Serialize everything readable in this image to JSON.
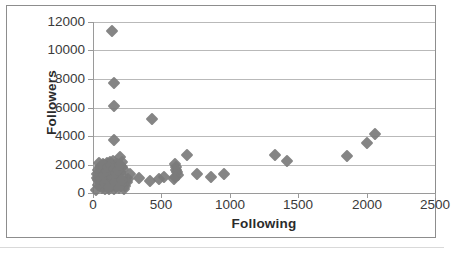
{
  "chart_data": {
    "type": "scatter",
    "title": "",
    "xlabel": "Following",
    "ylabel": "Followers",
    "xlim": [
      0,
      2500
    ],
    "ylim": [
      0,
      12000
    ],
    "xticks": [
      0,
      500,
      1000,
      1500,
      2000,
      2500
    ],
    "yticks": [
      0,
      2000,
      4000,
      6000,
      8000,
      10000,
      12000
    ],
    "xtick_labels": [
      "0",
      "500",
      "1000",
      "1500",
      "2000",
      "2500"
    ],
    "ytick_labels": [
      "0",
      "2000",
      "4000",
      "6000",
      "8000",
      "10000",
      "12000"
    ],
    "grid": "horizontal",
    "legend": "none",
    "marker": "diamond",
    "marker_color": "#7b7b7b",
    "series": [
      {
        "name": "accounts",
        "points": [
          [
            140,
            11350
          ],
          [
            150,
            7750
          ],
          [
            150,
            6100
          ],
          [
            430,
            5200
          ],
          [
            150,
            3700
          ],
          [
            2060,
            4150
          ],
          [
            2000,
            3500
          ],
          [
            1860,
            2600
          ],
          [
            690,
            2700
          ],
          [
            1330,
            2650
          ],
          [
            1420,
            2250
          ],
          [
            200,
            2500
          ],
          [
            215,
            2150
          ],
          [
            190,
            2000
          ],
          [
            600,
            2050
          ],
          [
            610,
            1800
          ],
          [
            605,
            1600
          ],
          [
            615,
            1450
          ],
          [
            620,
            1250
          ],
          [
            600,
            1100
          ],
          [
            595,
            950
          ],
          [
            760,
            1350
          ],
          [
            960,
            1300
          ],
          [
            860,
            1150
          ],
          [
            335,
            1050
          ],
          [
            420,
            850
          ],
          [
            480,
            1000
          ],
          [
            520,
            1150
          ],
          [
            270,
            1300
          ],
          [
            255,
            1000
          ],
          [
            245,
            750
          ],
          [
            235,
            500
          ],
          [
            225,
            300
          ],
          [
            30,
            1050
          ],
          [
            40,
            900
          ],
          [
            50,
            1400
          ],
          [
            55,
            700
          ],
          [
            60,
            1850
          ],
          [
            65,
            1500
          ],
          [
            70,
            500
          ],
          [
            75,
            1250
          ],
          [
            80,
            2000
          ],
          [
            85,
            300
          ],
          [
            90,
            1650
          ],
          [
            95,
            1150
          ],
          [
            100,
            800
          ],
          [
            105,
            2100
          ],
          [
            110,
            450
          ],
          [
            115,
            1550
          ],
          [
            120,
            1900
          ],
          [
            125,
            1000
          ],
          [
            130,
            1350
          ],
          [
            135,
            600
          ],
          [
            140,
            1750
          ],
          [
            145,
            2250
          ],
          [
            150,
            1450
          ],
          [
            155,
            250
          ],
          [
            160,
            1150
          ],
          [
            165,
            1900
          ],
          [
            170,
            800
          ],
          [
            175,
            1600
          ],
          [
            180,
            1300
          ],
          [
            185,
            950
          ],
          [
            190,
            1750
          ],
          [
            195,
            550
          ],
          [
            200,
            1450
          ],
          [
            25,
            200
          ],
          [
            35,
            1600
          ],
          [
            45,
            2100
          ],
          [
            55,
            1100
          ],
          [
            65,
            350
          ],
          [
            75,
            1900
          ],
          [
            85,
            1400
          ],
          [
            95,
            1700
          ],
          [
            105,
            950
          ],
          [
            115,
            250
          ],
          [
            125,
            2150
          ],
          [
            135,
            1200
          ],
          [
            145,
            850
          ],
          [
            155,
            1950
          ],
          [
            165,
            450
          ],
          [
            175,
            2050
          ],
          [
            185,
            1050
          ],
          [
            195,
            1500
          ],
          [
            205,
            650
          ],
          [
            210,
            1850
          ],
          [
            215,
            1200
          ],
          [
            220,
            1650
          ],
          [
            30,
            1350
          ],
          [
            40,
            550
          ],
          [
            50,
            1800
          ],
          [
            60,
            950
          ],
          [
            70,
            2050
          ],
          [
            80,
            1250
          ],
          [
            90,
            700
          ],
          [
            100,
            1550
          ],
          [
            110,
            1800
          ],
          [
            120,
            400
          ],
          [
            130,
            2000
          ],
          [
            140,
            1050
          ],
          [
            150,
            1650
          ],
          [
            160,
            750
          ],
          [
            170,
            1400
          ],
          [
            180,
            1600
          ],
          [
            190,
            350
          ],
          [
            200,
            1950
          ],
          [
            210,
            900
          ]
        ]
      }
    ]
  },
  "axis": {
    "y_title": "Followers",
    "x_title": "Following"
  }
}
